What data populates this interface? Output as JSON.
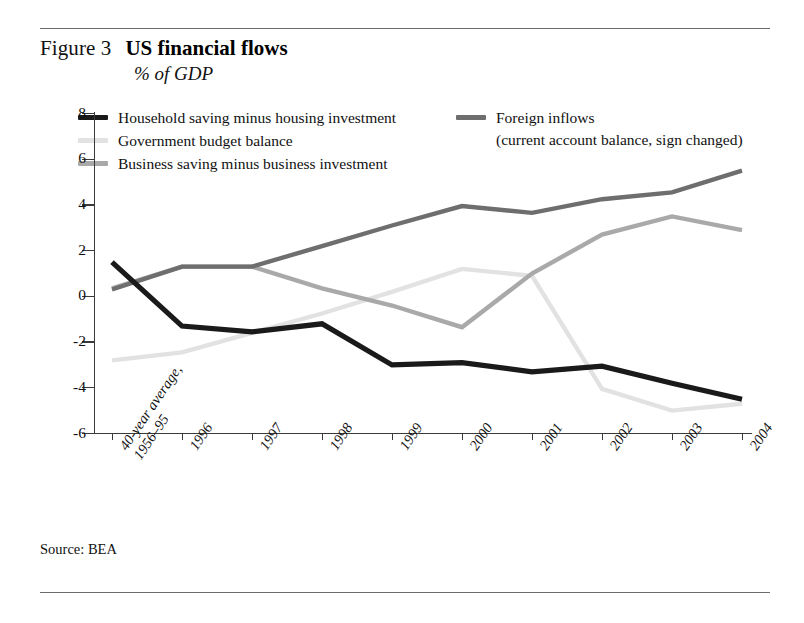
{
  "figure": {
    "label": "Figure 3",
    "title": "US financial flows",
    "subtitle": "% of GDP"
  },
  "source": "Source: BEA",
  "colors": {
    "household": "#1a1a1a",
    "government": "#e2e2e2",
    "business": "#a9a9a9",
    "foreign": "#6e6e6e",
    "axis": "#3a3a3a",
    "rule": "#6b6b6b"
  },
  "legend": {
    "left": [
      {
        "label": "Household saving minus housing investment",
        "color": "#1a1a1a",
        "series": "household"
      },
      {
        "label": "Government budget balance",
        "color": "#e2e2e2",
        "series": "government"
      },
      {
        "label": "Business saving minus business investment",
        "color": "#a9a9a9",
        "series": "business"
      }
    ],
    "right": [
      {
        "label": "Foreign inflows",
        "sublabel": "(current account balance, sign changed)",
        "color": "#6e6e6e",
        "series": "foreign"
      }
    ]
  },
  "axes": {
    "y_ticks": [
      "8",
      "6",
      "4",
      "2",
      "0",
      "-2",
      "-4",
      "-6"
    ],
    "x_labels": [
      "40-year average,\n1956–95",
      "1996",
      "1997",
      "1998",
      "1999",
      "2000",
      "2001",
      "2002",
      "2003",
      "2004"
    ]
  },
  "chart_data": {
    "type": "line",
    "title": "US financial flows",
    "subtitle": "% of GDP",
    "xlabel": "",
    "ylabel": "% of GDP",
    "ylim": [
      -6,
      8
    ],
    "ytick_step": 2,
    "grid": false,
    "legend_position": "top",
    "categories": [
      "40-year average, 1956–95",
      "1996",
      "1997",
      "1998",
      "1999",
      "2000",
      "2001",
      "2002",
      "2003",
      "2004"
    ],
    "series": [
      {
        "name": "Household saving minus housing investment",
        "color": "#1a1a1a",
        "values": [
          1.5,
          -1.3,
          -1.55,
          -1.2,
          -3.0,
          -2.9,
          -3.3,
          -3.05,
          -3.8,
          -4.5
        ]
      },
      {
        "name": "Government budget balance",
        "color": "#e2e2e2",
        "values": [
          -2.8,
          -2.45,
          -1.6,
          -0.75,
          0.2,
          1.2,
          0.9,
          -4.05,
          -5.0,
          -4.7
        ]
      },
      {
        "name": "Business saving minus business investment",
        "color": "#a9a9a9",
        "values": [
          0.35,
          1.3,
          1.3,
          0.35,
          -0.4,
          -1.35,
          1.0,
          2.7,
          3.5,
          2.9
        ]
      },
      {
        "name": "Foreign inflows (current account balance, sign changed)",
        "color": "#6e6e6e",
        "values": [
          0.3,
          1.3,
          1.3,
          2.2,
          3.1,
          3.95,
          3.65,
          4.25,
          4.55,
          5.5
        ]
      }
    ]
  }
}
